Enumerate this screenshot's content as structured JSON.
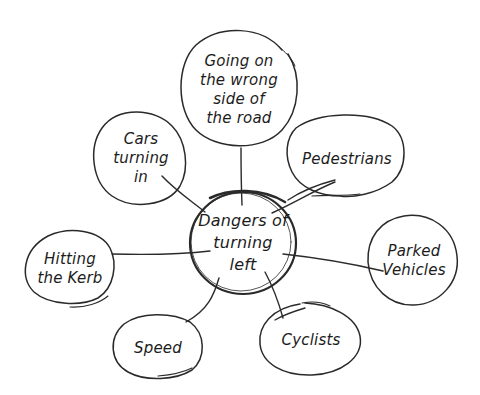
{
  "diagram": {
    "type": "mind-map",
    "style": "hand-drawn",
    "stroke_color": "#2a2a2a",
    "background": "#ffffff",
    "center": {
      "id": "center",
      "label": "Dangers of\nturning\nleft"
    },
    "nodes": [
      {
        "id": "wrong-side",
        "label": "Going on\nthe wrong\nside of\nthe road"
      },
      {
        "id": "cars-turning-in",
        "label": "Cars\nturning\nin"
      },
      {
        "id": "pedestrians",
        "label": "Pedestrians"
      },
      {
        "id": "hitting-kerb",
        "label": "Hitting\nthe Kerb"
      },
      {
        "id": "parked-vehicles",
        "label": "Parked\nVehicles"
      },
      {
        "id": "speed",
        "label": "Speed"
      },
      {
        "id": "cyclists",
        "label": "Cyclists"
      }
    ],
    "edges": [
      {
        "from": "center",
        "to": "wrong-side"
      },
      {
        "from": "center",
        "to": "cars-turning-in"
      },
      {
        "from": "center",
        "to": "pedestrians"
      },
      {
        "from": "center",
        "to": "hitting-kerb"
      },
      {
        "from": "center",
        "to": "parked-vehicles"
      },
      {
        "from": "center",
        "to": "speed"
      },
      {
        "from": "center",
        "to": "cyclists"
      }
    ]
  }
}
